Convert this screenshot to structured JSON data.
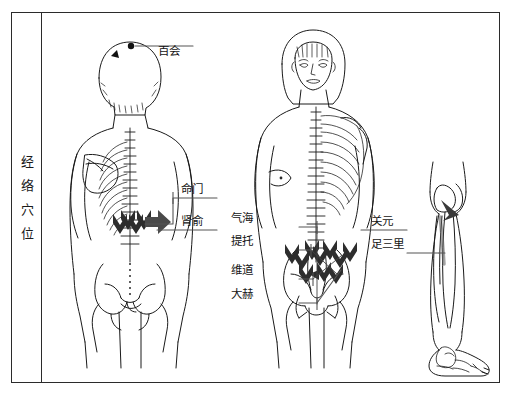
{
  "figure": {
    "title_vertical": [
      "经",
      "络",
      "穴",
      "位"
    ],
    "title_plain": "经络穴位",
    "background_color": "#ffffff",
    "ink_color": "#1a1a1a",
    "marker_color": "#2a2a2a",
    "border_color": "#2b2b2b"
  },
  "panels": [
    {
      "name": "back-view-figure",
      "view": "posterior",
      "description": "male back view with spine, ribs, scapulae and pelvis"
    },
    {
      "name": "front-view-figure",
      "view": "anterior",
      "description": "female front view with half skeleton overlay"
    },
    {
      "name": "leg-detail-figure",
      "view": "lateral-lower-leg",
      "description": "right lower leg and foot with tibia and fibula"
    }
  ],
  "labels": {
    "baihui": "百会",
    "mingmen": "命门",
    "shenshu": "肾俞",
    "qihai": "气海",
    "tituo": "提托",
    "weidao": "维道",
    "dahe": "大赫",
    "guanyuan": "关元",
    "zusanli": "足三里"
  }
}
